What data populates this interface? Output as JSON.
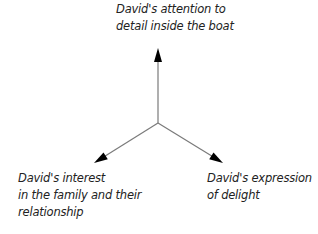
{
  "diagram": {
    "type": "three-axis-arrows",
    "center": {
      "x": 158,
      "y": 123
    },
    "line_color": "#7a7a7a",
    "arrowhead_color": "#000000",
    "axes": [
      {
        "name": "top",
        "tip": {
          "x": 158,
          "y": 50
        },
        "label_lines": [
          "David's attention to",
          "detail inside the boat"
        ]
      },
      {
        "name": "left",
        "tip": {
          "x": 95,
          "y": 162
        },
        "label_lines": [
          "David's interest",
          "in the family and their",
          "relationship"
        ]
      },
      {
        "name": "right",
        "tip": {
          "x": 222,
          "y": 162
        },
        "label_lines": [
          "David's expression",
          "of delight"
        ]
      }
    ]
  }
}
